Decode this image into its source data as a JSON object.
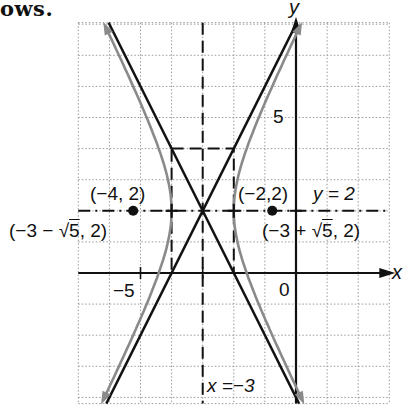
{
  "caption_fragment": "ows.",
  "chart_data": {
    "type": "line",
    "title": "",
    "xlabel": "x",
    "ylabel": "y",
    "xlim": [
      -7,
      3
    ],
    "ylim": [
      -4.2,
      8.05
    ],
    "grid": true,
    "grid_step": 1,
    "tick_labels": [
      {
        "text": "5",
        "axis": "y",
        "value": 5
      },
      {
        "text": "−5",
        "axis": "x",
        "value": -5
      },
      {
        "text": "0",
        "axis": "origin",
        "value": 0
      }
    ],
    "hyperbola": {
      "equation": "(x+3)^2 - (y-2)^2/4 = 1",
      "center": [
        -3,
        2
      ],
      "a": 1,
      "b": 2,
      "color": "#8a8a8a"
    },
    "asymptotes": [
      {
        "equation": "y - 2 = 2(x + 3)",
        "slope": 2
      },
      {
        "equation": "y - 2 = -2(x + 3)",
        "slope": -2
      }
    ],
    "dashed_lines": [
      {
        "label": "x = −3",
        "type": "vertical",
        "value": -3
      },
      {
        "label": "y = 2",
        "type": "horizontal",
        "value": 2
      }
    ],
    "rectangle": {
      "x": [
        -4,
        -2
      ],
      "y": [
        0,
        4
      ],
      "style": "dashed"
    },
    "points": [
      {
        "label": "(−4, 2)",
        "x": -4,
        "y": 2,
        "marker": "tick"
      },
      {
        "label": "(−2,2)",
        "x": -2,
        "y": 2,
        "marker": "tick"
      },
      {
        "label": "(−3 − √5, 2)",
        "x": -5.236,
        "y": 2,
        "marker": "dot"
      },
      {
        "label": "(−3 + √5, 2)",
        "x": -0.764,
        "y": 2,
        "marker": "dot"
      },
      {
        "label": "center",
        "x": -3,
        "y": 2,
        "marker": "none"
      }
    ],
    "annotations": [
      {
        "text": "y = 2"
      },
      {
        "text": "x = −3"
      }
    ],
    "colors": {
      "axis": "#111111",
      "grid": "#9a9a9a",
      "hyperbola": "#8a8a8a",
      "asymptote": "#111111"
    }
  },
  "labels": {
    "y_axis": "y",
    "x_axis": "x",
    "tick_5": "5",
    "tick_neg5": "−5",
    "origin": "0",
    "vertex_left": "(−4, 2)",
    "vertex_right": "(−2,2)",
    "focus_left_prefix": "(−3 − ",
    "focus_left_root": "5",
    "focus_left_suffix": ", 2)",
    "focus_right_prefix": "(−3 + ",
    "focus_right_root": "5",
    "focus_right_suffix": ", 2)",
    "line_y2": "y = 2",
    "line_xneg3": "x =−3",
    "sqrt_symbol": "√"
  }
}
